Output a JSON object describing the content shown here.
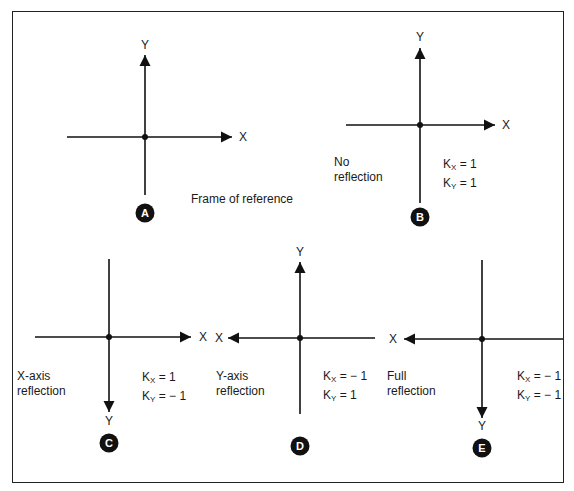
{
  "figure": {
    "border_color": "#222222",
    "line_color": "#111111"
  },
  "panels": [
    {
      "id": "A",
      "badge": "A",
      "caption": [
        "Frame of reference"
      ],
      "k_x": null,
      "k_y": null,
      "origin": [
        145,
        137
      ],
      "x_axis": {
        "from": 67,
        "to": 232,
        "arrow": "right",
        "label": "X",
        "label_pos": [
          243,
          137
        ]
      },
      "y_axis": {
        "from": 195,
        "to": 55,
        "arrow": "up",
        "label": "Y",
        "label_pos": [
          145,
          45
        ]
      },
      "badge_pos": [
        145,
        213
      ],
      "caption_pos": [
        191,
        192
      ],
      "k_pos": null
    },
    {
      "id": "B",
      "badge": "B",
      "caption": [
        "No",
        "reflection"
      ],
      "k_x": "1",
      "k_y": "1",
      "origin": [
        420,
        125
      ],
      "x_axis": {
        "from": 346,
        "to": 495,
        "arrow": "right",
        "label": "X",
        "label_pos": [
          506,
          125
        ]
      },
      "y_axis": {
        "from": 203,
        "to": 48,
        "arrow": "up",
        "label": "Y",
        "label_pos": [
          420,
          37
        ]
      },
      "badge_pos": [
        420,
        217
      ],
      "caption_pos": [
        334,
        155
      ],
      "k_pos": [
        443,
        157
      ]
    },
    {
      "id": "C",
      "badge": "C",
      "caption": [
        "X-axis",
        "reflection"
      ],
      "k_x": "1",
      "k_y": "− 1",
      "origin": [
        109,
        337
      ],
      "x_axis": {
        "from": 35,
        "to": 191,
        "arrow": "right",
        "label": "X",
        "label_pos": [
          203,
          337
        ]
      },
      "y_axis": {
        "from": 259,
        "to": 412,
        "arrow": "down",
        "label": "Y",
        "label_pos": [
          109,
          421
        ]
      },
      "badge_pos": [
        109,
        443
      ],
      "caption_pos": [
        17,
        369
      ],
      "k_pos": [
        142,
        370
      ]
    },
    {
      "id": "D",
      "badge": "D",
      "caption": [
        "Y-axis",
        "reflection"
      ],
      "k_x": "− 1",
      "k_y": "1",
      "origin": [
        300,
        338
      ],
      "x_axis": {
        "from": 375,
        "to": 228,
        "arrow": "left",
        "label": "X",
        "label_pos": [
          219,
          338
        ]
      },
      "y_axis": {
        "from": 414,
        "to": 262,
        "arrow": "up",
        "label": "Y",
        "label_pos": [
          300,
          252
        ]
      },
      "badge_pos": [
        300,
        446
      ],
      "caption_pos": [
        216,
        369
      ],
      "k_pos": [
        323,
        369
      ]
    },
    {
      "id": "E",
      "badge": "E",
      "caption": [
        "Full",
        "reflection"
      ],
      "k_x": "− 1",
      "k_y": "− 1",
      "origin": [
        482,
        339
      ],
      "x_axis": {
        "from": 563,
        "to": 404,
        "arrow": "left",
        "label": "X",
        "label_pos": [
          393,
          339
        ]
      },
      "y_axis": {
        "from": 260,
        "to": 418,
        "arrow": "down",
        "label": "Y",
        "label_pos": [
          482,
          426
        ]
      },
      "badge_pos": [
        482,
        448
      ],
      "caption_pos": [
        387,
        369
      ],
      "k_pos": [
        517,
        369
      ]
    }
  ],
  "k_labels": {
    "kx": "K",
    "kx_sub": "X",
    "ky": "K",
    "ky_sub": "Y"
  }
}
